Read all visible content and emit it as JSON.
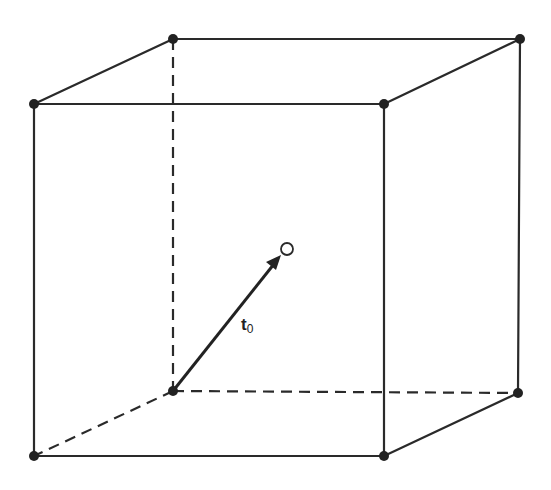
{
  "figure": {
    "vector_label": {
      "symbol": "t",
      "subscript": "0"
    },
    "colors": {
      "line": "#2a2a2a",
      "background": "#ffffff"
    },
    "vertices": {
      "front_top_left": [
        34,
        104
      ],
      "front_top_right": [
        384,
        104
      ],
      "front_bottom_left": [
        34,
        456
      ],
      "front_bottom_right": [
        384,
        456
      ],
      "back_top_left": [
        173,
        39
      ],
      "back_top_right": [
        520,
        39
      ],
      "back_bottom_left": [
        173,
        391
      ],
      "back_bottom_right": [
        518,
        393
      ]
    },
    "body_center": [
      287,
      249
    ],
    "solid_edges": [
      [
        "front_top_left",
        "front_top_right"
      ],
      [
        "front_top_right",
        "front_bottom_right"
      ],
      [
        "front_bottom_right",
        "front_bottom_left"
      ],
      [
        "front_bottom_left",
        "front_top_left"
      ],
      [
        "back_top_left",
        "back_top_right"
      ],
      [
        "back_top_right",
        "back_bottom_right"
      ],
      [
        "front_top_left",
        "back_top_left"
      ],
      [
        "front_top_right",
        "back_top_right"
      ],
      [
        "front_bottom_right",
        "back_bottom_right"
      ]
    ],
    "dashed_edges": [
      [
        "back_top_left",
        "back_bottom_left"
      ],
      [
        "back_bottom_left",
        "back_bottom_right"
      ],
      [
        "back_bottom_left",
        "front_bottom_left"
      ]
    ]
  }
}
